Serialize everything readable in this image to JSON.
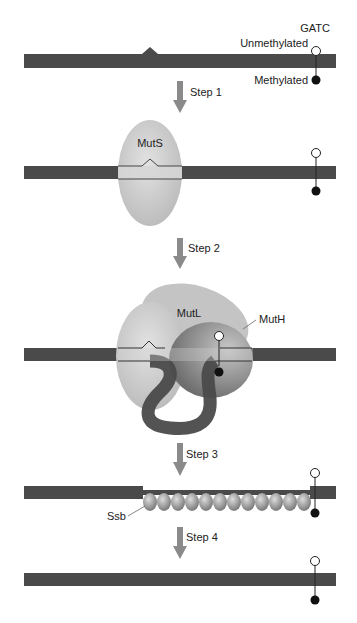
{
  "figure": {
    "labels": {
      "gatc": "GATC",
      "unmethylated": "Unmethylated",
      "methylated": "Methylated",
      "muts": "MutS",
      "mutl": "MutL",
      "muth": "MutH",
      "ssb": "Ssb"
    },
    "steps": [
      {
        "label": "Step 1"
      },
      {
        "label": "Step 2"
      },
      {
        "label": "Step 3"
      },
      {
        "label": "Step 4"
      }
    ],
    "colors": {
      "dna": "#4a4a4a",
      "arrow": "#8a8a8a",
      "muts": "#cfcfcf",
      "mutl": "#c8c8c8",
      "muth": "#8c8c8c",
      "ssb": "#a0a0a0"
    },
    "ssb_bead_count": 12
  }
}
